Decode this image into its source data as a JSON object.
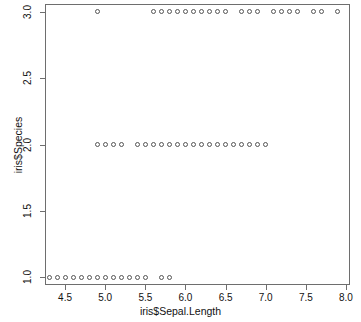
{
  "chart_data": {
    "type": "scatter",
    "title": "",
    "xlabel": "iris$Sepal.Length",
    "ylabel": "iris$Species",
    "xlim": [
      4.25,
      8.05
    ],
    "ylim": [
      0.94,
      3.06
    ],
    "xticks": [
      4.5,
      5.0,
      5.5,
      6.0,
      6.5,
      7.0,
      7.5,
      8.0
    ],
    "xticklabels": [
      "4.5",
      "5.0",
      "5.5",
      "6.0",
      "6.5",
      "7.0",
      "7.5",
      "8.0"
    ],
    "yticks": [
      1.0,
      1.5,
      2.0,
      2.5,
      3.0
    ],
    "yticklabels": [
      "1.0",
      "1.5",
      "2.0",
      "2.5",
      "3.0"
    ],
    "grid": false,
    "legend": null,
    "marker": "open-circle",
    "marker_color": "#555555",
    "frame_color": "#6e6e6e",
    "background": "#ffffff",
    "series": [
      {
        "name": "setosa",
        "y": 1.0,
        "x": [
          4.3,
          4.4,
          4.5,
          4.6,
          4.7,
          4.8,
          4.9,
          5.0,
          5.1,
          5.2,
          5.3,
          5.4,
          5.5,
          5.7,
          5.8
        ]
      },
      {
        "name": "versicolor",
        "y": 2.0,
        "x": [
          4.9,
          5.0,
          5.1,
          5.2,
          5.4,
          5.5,
          5.6,
          5.7,
          5.8,
          5.9,
          6.0,
          6.1,
          6.2,
          6.3,
          6.4,
          6.5,
          6.6,
          6.7,
          6.8,
          6.9,
          7.0
        ]
      },
      {
        "name": "virginica",
        "y": 3.0,
        "x": [
          4.9,
          5.6,
          5.7,
          5.8,
          5.9,
          6.0,
          6.1,
          6.2,
          6.3,
          6.4,
          6.5,
          6.7,
          6.8,
          6.9,
          7.1,
          7.2,
          7.3,
          7.4,
          7.6,
          7.7,
          7.9
        ]
      }
    ]
  }
}
